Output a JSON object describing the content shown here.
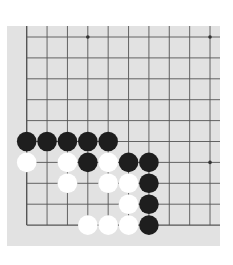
{
  "board": {
    "background": "#e2e2e2",
    "line_color": "#555555",
    "columns": 10,
    "rows": 10,
    "origin": [
      26.7,
      37
    ],
    "spacing_x": 20.37,
    "spacing_y": 20.9,
    "edges": {
      "left": true,
      "bottom": true,
      "top": false,
      "right": false
    },
    "star_points": [
      [
        3,
        0
      ],
      [
        9,
        0
      ],
      [
        9,
        6
      ]
    ]
  },
  "stones": [
    {
      "color": "black",
      "col": 0,
      "row": 5
    },
    {
      "color": "black",
      "col": 1,
      "row": 5
    },
    {
      "color": "black",
      "col": 2,
      "row": 5
    },
    {
      "color": "black",
      "col": 3,
      "row": 5
    },
    {
      "color": "black",
      "col": 4,
      "row": 5
    },
    {
      "color": "white",
      "col": 0,
      "row": 6
    },
    {
      "color": "white",
      "col": 2,
      "row": 6
    },
    {
      "color": "black",
      "col": 3,
      "row": 6
    },
    {
      "color": "white",
      "col": 4,
      "row": 6
    },
    {
      "color": "black",
      "col": 5,
      "row": 6
    },
    {
      "color": "black",
      "col": 6,
      "row": 6
    },
    {
      "color": "white",
      "col": 2,
      "row": 7
    },
    {
      "color": "white",
      "col": 4,
      "row": 7
    },
    {
      "color": "white",
      "col": 5,
      "row": 7
    },
    {
      "color": "black",
      "col": 6,
      "row": 7
    },
    {
      "color": "white",
      "col": 5,
      "row": 8
    },
    {
      "color": "black",
      "col": 6,
      "row": 8
    },
    {
      "color": "white",
      "col": 3,
      "row": 9
    },
    {
      "color": "white",
      "col": 4,
      "row": 9
    },
    {
      "color": "white",
      "col": 5,
      "row": 9
    },
    {
      "color": "black",
      "col": 6,
      "row": 9
    }
  ],
  "stone_colors": {
    "black": "#1e1e1e",
    "white": "#ffffff"
  }
}
